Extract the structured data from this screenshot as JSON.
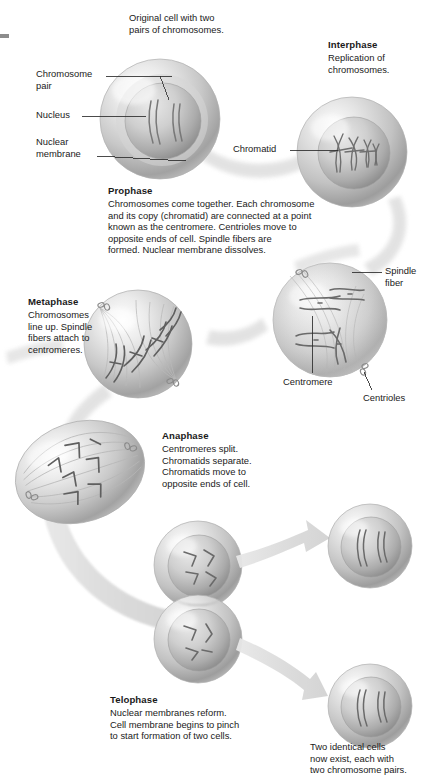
{
  "diagram": {
    "top_caption": "Original cell with two\npairs of chromosomes.",
    "bottom_caption": "Two identical cells\nnow exist, each with\ntwo chromosome pairs."
  },
  "callouts": {
    "chromosome_pair": "Chromosome\npair",
    "nucleus": "Nucleus",
    "nuclear_membrane": "Nuclear\nmembrane",
    "chromatid": "Chromatid",
    "spindle_fiber": "Spindle\nfiber",
    "centromere": "Centromere",
    "centrioles": "Centrioles"
  },
  "phases": [
    {
      "id": "interphase",
      "title": "Interphase",
      "text": "Replication of\nchromosomes."
    },
    {
      "id": "prophase",
      "title": "Prophase",
      "text": "Chromosomes come together. Each chromosome\nand its copy (chromatid) are connected at a point\nknown as the centromere. Centrioles move to\nopposite ends of cell. Spindle fibers are\nformed. Nuclear membrane dissolves."
    },
    {
      "id": "metaphase",
      "title": "Metaphase",
      "text": "Chromosomes\nline up. Spindle\nfibers attach to\ncentromeres."
    },
    {
      "id": "anaphase",
      "title": "Anaphase",
      "text": "Centromeres split.\nChromatids separate.\nChromatids move to\nopposite ends of cell."
    },
    {
      "id": "telophase",
      "title": "Telophase",
      "text": "Nuclear membranes reform.\nCell membrane begins to pinch\nto start formation of two cells."
    }
  ],
  "colors": {
    "text": "#1a1a1a",
    "leader_line": "#2b2b2b",
    "cell_light": "#f2f2f2",
    "cell_mid": "#c9c9c9",
    "cell_dark": "#9a9a9a",
    "nucleus": "#b8b8b8",
    "chromosome": "#6d6d6d",
    "arrow": "#d9d9d9",
    "background": "#ffffff"
  }
}
